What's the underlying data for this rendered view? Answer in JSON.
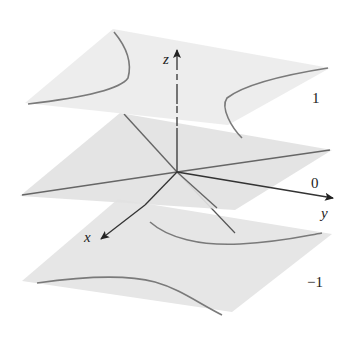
{
  "figure": {
    "axes": {
      "x_label": "x",
      "y_label": "y",
      "z_label": "z"
    },
    "levels": [
      {
        "value": 1,
        "label": "1"
      },
      {
        "value": 0,
        "label": "0"
      },
      {
        "value": -1,
        "label": "−1"
      }
    ],
    "colors": {
      "plane_fill": "#e9e9e9",
      "plane_fill_middle": "#e2e2e2",
      "curve": "#777777",
      "axis": "#333333"
    }
  }
}
